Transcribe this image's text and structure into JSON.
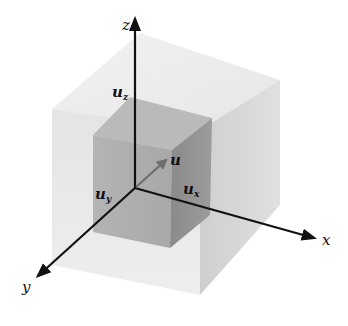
{
  "diagram": {
    "type": "3d-vector-decomposition",
    "axes": {
      "x": {
        "label": "x"
      },
      "y": {
        "label": "y"
      },
      "z": {
        "label": "z"
      }
    },
    "vector": {
      "label": "u"
    },
    "components": {
      "x": {
        "label": "u",
        "sub": "x"
      },
      "y": {
        "label": "u",
        "sub": "y"
      },
      "z": {
        "label": "u",
        "sub": "z"
      }
    },
    "colors": {
      "axis": "#111111",
      "vector": "#6e6e6e",
      "outer_cube_top": "#ececec",
      "outer_cube_left": "#e2e2e2",
      "outer_cube_right": "#d6d6d6",
      "inner_cube_top": "#b8b8b8",
      "inner_cube_front": "#a9a9a9",
      "inner_cube_right": "#8f8f8f"
    }
  }
}
